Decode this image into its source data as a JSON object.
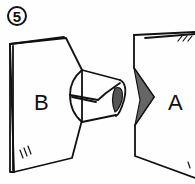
{
  "diagram": {
    "step_number": "5",
    "panels": [
      {
        "id": "B",
        "label": "B"
      },
      {
        "id": "A",
        "label": "A"
      }
    ],
    "colors": {
      "ink": "#111111",
      "paper": "#fefefe"
    }
  }
}
